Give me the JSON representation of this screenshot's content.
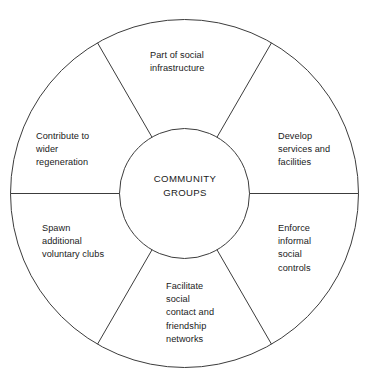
{
  "diagram": {
    "type": "circular-wheel-diagram",
    "hub": {
      "name": "community-groups-hub",
      "text": "COMMUNITY\nGROUPS"
    },
    "geometry": {
      "center_x": 184.5,
      "center_y": 193.5,
      "outer_radius": 174,
      "inner_radius": 65,
      "segment_count": 6,
      "spoke_angles_deg": [
        0,
        60,
        120,
        180,
        240,
        300
      ]
    },
    "colors": {
      "stroke": "#3c3c3c",
      "background": "#ffffff",
      "text": "#1a1a1a"
    },
    "segments": [
      {
        "id": "part-of-social-infrastructure",
        "text": "Part of social\ninfrastructure"
      },
      {
        "id": "develop-services-and-facilities",
        "text": "Develop\nservices and\nfacilities"
      },
      {
        "id": "enforce-informal-social-controls",
        "text": "Enforce\ninformal\nsocial\ncontrols"
      },
      {
        "id": "facilitate-social-contact-and-friendship-networks",
        "text": "Facilitate\nsocial\ncontact and\nfriendship\nnetworks"
      },
      {
        "id": "spawn-additional-voluntary-clubs",
        "text": "Spawn\nadditional\nvoluntary clubs"
      },
      {
        "id": "contribute-to-wider-regeneration",
        "text": "Contribute to\nwider\nregeneration"
      }
    ]
  }
}
